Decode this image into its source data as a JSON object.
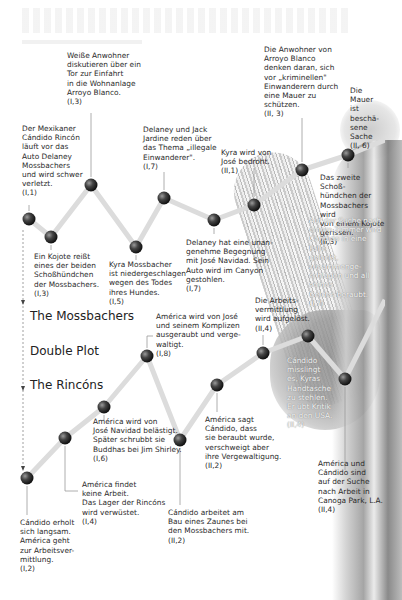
{
  "legend": {
    "mossbachers": "The Mossbachers",
    "double_plot": "Double Plot",
    "rincons": "The Rincóns"
  },
  "mossbachers_events": [
    {
      "text": "Der Mexikaner\nCándido Rincón\nläuft vor das\nAuto Delaney\nMossbachers\nund wird schwer\nverletzt.",
      "ref": "(I,1)"
    },
    {
      "text": "Ein Kojote reißt\neines der beiden\nSchoßhündchen\nder Mossbachers.",
      "ref": "(I,3)"
    },
    {
      "text": "Weiße Anwohner\ndiskutieren über ein\nTor zur Einfahrt\nin die Wohnanlage\nArroyo Blanco.",
      "ref": "(I,3)"
    },
    {
      "text": "Kyra Mossbacher\nist niedergeschlagen\nwegen des Todes\nihres Hundes.",
      "ref": "(I,5)"
    },
    {
      "text": "Delaney und Jack\nJardine reden über\ndas Thema „illegale\nEinwanderer\".",
      "ref": "(I,7)"
    },
    {
      "text": "Delaney hat eine unan-\ngenehme Begegnung\nmit José Navidad. Sein\nAuto wird im Canyon\ngestohlen.",
      "ref": "(I,7)"
    },
    {
      "text": "Kyra wird von\nJosé bedroht.",
      "ref": "(II,1)"
    },
    {
      "text": "Die Anwohner von\nArroyo Blanco\ndenken daran, sich\nvor „kriminellen\"\nEinwanderern durch\neine Mauer zu\nschützen.",
      "ref": "(II, 3)"
    },
    {
      "text": "Das zweite Schoß-\nhündchen der\nMossbachers wird\nvon einem Kojote\ngerissen.",
      "ref": "(II,3)"
    },
    {
      "text": "Die Mauer\nist beschä-\nsene Sache",
      "ref": "(II, 6)"
    }
  ],
  "rincons_events": [
    {
      "text": "Cándido erholt\nsich langsam.\nAmérica geht\nzur Arbeitsver-\nmittlung.",
      "ref": "(I,2)"
    },
    {
      "text": "América findet\nkeine Arbeit.\nDas Lager  der Rincóns\nwird verwüstet.",
      "ref": "(I,4)"
    },
    {
      "text": "América wird von\nJosé Navidad belästigt.\nSpäter schrubbt sie\nBuddhas bei Jim Shirley.",
      "ref": "(I,6)"
    },
    {
      "text": "América wird  von José\nund seinem Komplizen\nausgeraubt und verge-\nwaltigt.",
      "ref": "(I,8)"
    },
    {
      "text": "Cándido arbeitet am\nBau eines Zaunes bei\nden Mossbachers mit.",
      "ref": "(II,2)"
    },
    {
      "text": "América sagt\nCándido, dass\nsie beraubt wurde,\nverschweigt aber\nihre Vergewaltigung.",
      "ref": "(II,2)"
    },
    {
      "text": "Die Arbeits-\nvermittlung\nwird aufgelöst.",
      "ref": "(II,4)"
    },
    {
      "text": "Cándido\nmisslingt\nes, Kyras\nHandtasche\nzu stehlen.\nEr übt Kritik\nan den USA.",
      "ref": "(II,4)"
    },
    {
      "text": "Auf der Suche nach\neinem Zimmer wird\nCándido in eine Falle\ngelockt, zusammenge-\nschlagen und all seines\nGeldes beraubt.",
      "ref": "(I,7)"
    },
    {
      "text": "América und\nCándido sind\nauf der Suche\nnach Arbeit in\nCanoga Park, L.A.",
      "ref": "(II,4)"
    }
  ],
  "colors": {
    "node": "#3a3a3a",
    "connector": "#d9d9d9",
    "leader": "#8a8a8a",
    "text": "#2b2b2b"
  }
}
